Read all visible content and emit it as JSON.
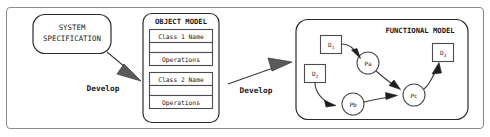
{
  "figure": {
    "colors": {
      "background": "#ffffff",
      "frame_stroke": "#8c8c8c",
      "box_stroke": "#4d4d4d",
      "text": "#1a1a1a",
      "arrow_fill": "#5a5a5a",
      "small_arrow_fill": "#1f1f1f"
    }
  },
  "system_spec": {
    "line1": "SYSTEM",
    "line2": "SPECIFICATION"
  },
  "transitions": {
    "develop_1": "Develop",
    "develop_2": "Develop"
  },
  "object_model": {
    "title": "OBJECT MODEL",
    "classes": [
      {
        "name": "Class 1 Name",
        "attributes": "",
        "operations": "Operations"
      },
      {
        "name": "Class 2 Name",
        "attributes": "",
        "operations": "Operations"
      }
    ]
  },
  "functional_model": {
    "title": "FUNCTIONAL MODEL",
    "data_stores": [
      {
        "id": "d1",
        "base": "D",
        "sub": "1"
      },
      {
        "id": "d2",
        "base": "D",
        "sub": "2"
      },
      {
        "id": "d3",
        "base": "D",
        "sub": "3"
      }
    ],
    "processes": [
      {
        "id": "pa",
        "label": "Pa"
      },
      {
        "id": "pb",
        "label": "Pb"
      },
      {
        "id": "pc",
        "label": "Pc"
      }
    ],
    "edges": [
      {
        "from": "d1",
        "to": "pa"
      },
      {
        "from": "pa",
        "to": "pc"
      },
      {
        "from": "d2",
        "to": "pb"
      },
      {
        "from": "pb",
        "to": "pc"
      },
      {
        "from": "pc",
        "to": "d3"
      }
    ]
  }
}
